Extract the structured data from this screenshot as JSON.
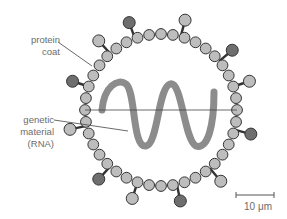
{
  "diagram": {
    "labels": {
      "protein_coat": "protein\ncoat",
      "genetic_material": "genetic\nmaterial\n(RNA)",
      "scale": "10 μm"
    },
    "colors": {
      "bead": "#bdbdbd",
      "bead_stroke": "#333333",
      "spike_light": "#bdbdbd",
      "spike_dark": "#6e6e6e",
      "rna": "#8c8c8c",
      "leader": "#444444",
      "label_text": "#6b6b6b"
    },
    "capsid": {
      "cx": 161,
      "cy": 110,
      "r": 76,
      "bead_count": 40
    },
    "spikes": [
      {
        "angle": 228,
        "shade": "light"
      },
      {
        "angle": 250,
        "shade": "dark"
      },
      {
        "angle": 285,
        "shade": "light"
      },
      {
        "angle": 320,
        "shade": "dark"
      },
      {
        "angle": 342,
        "shade": "light"
      },
      {
        "angle": 15,
        "shade": "dark"
      },
      {
        "angle": 50,
        "shade": "light"
      },
      {
        "angle": 78,
        "shade": "dark"
      },
      {
        "angle": 108,
        "shade": "light"
      },
      {
        "angle": 132,
        "shade": "dark"
      },
      {
        "angle": 168,
        "shade": "light"
      },
      {
        "angle": 198,
        "shade": "dark"
      }
    ]
  }
}
